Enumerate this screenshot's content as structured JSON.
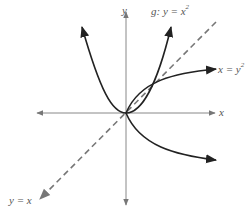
{
  "diagram": {
    "axes": {
      "x_label": "x",
      "y_label": "y"
    },
    "curves": [
      {
        "id": "g",
        "label_prefix": "g: y = x",
        "label_sup": "2",
        "style": "solid",
        "color": "#222222"
      },
      {
        "id": "inverse",
        "label_prefix": "x = y",
        "label_sup": "2",
        "style": "solid",
        "color": "#222222"
      },
      {
        "id": "identity",
        "label": "y = x",
        "style": "dashed",
        "color": "#777777"
      }
    ],
    "intersection_points": [
      "(0, 0)",
      "(1, 1)"
    ]
  },
  "labels": {
    "y_axis": "y",
    "x_axis": "x",
    "g_prefix": "g: y = x",
    "g_sup": "2",
    "inv_prefix": "x = y",
    "inv_sup": "2",
    "identity": "y = x"
  },
  "colors": {
    "axis": "#888888",
    "curve": "#222222",
    "dashed": "#777777",
    "text": "#555555"
  }
}
